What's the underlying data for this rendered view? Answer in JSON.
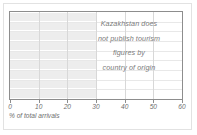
{
  "chart_data": {
    "type": "bar",
    "orientation": "horizontal",
    "title": "",
    "xlabel": "% of total arrivals",
    "ylabel": "",
    "xlim": [
      0,
      60
    ],
    "xticks": [
      0,
      10,
      20,
      30,
      40,
      50,
      60
    ],
    "xticklabels": [
      "0",
      "10",
      "20",
      "30",
      "40",
      "50",
      "60"
    ],
    "grid": true,
    "legend": false,
    "categories": [
      "",
      "",
      "",
      "",
      "",
      "",
      "",
      "",
      ""
    ],
    "values": [
      30,
      30,
      30,
      30,
      30,
      30,
      30,
      30,
      30
    ],
    "annotations": [
      "Kazakhstan does",
      "not publish tourism",
      "figures by",
      "country of origin"
    ],
    "bar_color": "#ededed",
    "grid_color": "#d8d8d8",
    "axis_color": "#8d8d8d",
    "text_color": "#7b7b7b"
  },
  "axis": {
    "xlabel": "% of total arrivals",
    "ticks": [
      {
        "value": 0,
        "label": "0"
      },
      {
        "value": 10,
        "label": "10"
      },
      {
        "value": 20,
        "label": "20"
      },
      {
        "value": 30,
        "label": "30"
      },
      {
        "value": 40,
        "label": "40"
      },
      {
        "value": 50,
        "label": "50"
      },
      {
        "value": 60,
        "label": "60"
      }
    ]
  },
  "annotation": {
    "line1": "Kazakhstan does",
    "line2": "not publish tourism",
    "line3": "figures by",
    "line4": "country of origin"
  }
}
